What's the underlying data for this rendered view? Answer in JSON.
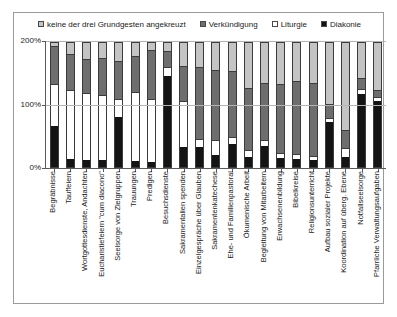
{
  "chart_data": {
    "type": "bar",
    "stacked": true,
    "title": "",
    "subtitle": "",
    "xlabel": "",
    "ylabel": "",
    "ylim": [
      0,
      200
    ],
    "ytick_labels": [
      "0%",
      "100%",
      "200%"
    ],
    "ytick_values": [
      0,
      100,
      200
    ],
    "grid": true,
    "legend_position": "top",
    "legend": [
      {
        "name": "keine der drei Grundgesten angekreuzt",
        "color": "#c4c4c4",
        "swatch": "light-gray"
      },
      {
        "name": "Verkündigung",
        "color": "#6e6e6e",
        "swatch": "dark-gray"
      },
      {
        "name": "Liturgie",
        "color": "#ffffff",
        "swatch": "white"
      },
      {
        "name": "Diakonie",
        "color": "#141414",
        "swatch": "black"
      }
    ],
    "categories": [
      "Begräbnisse",
      "Tauffeiern",
      "Wortgottesdienste, Andachten",
      "Eucharistiefeiern \"cum diacono\"",
      "Seelsorge von Zielgruppen",
      "Trauungen",
      "Predigen",
      "Besuchsdienste",
      "Sakramentalien spenden",
      "Einzelgespräche über Glauben",
      "Sakramentenkatechese",
      "Ehe- und Familienpastoral",
      "Ökumenische Arbeit",
      "Begleitung von Mitarbeitern",
      "Erwachsenenbildung",
      "Bibelkreise",
      "Religionsunterricht",
      "Aufbau sozialer Projekte",
      "Koordination auf überg. Ebene",
      "Notfallseelsorge",
      "Pfarrliche Verwaltungsaufgaben"
    ],
    "series": [
      {
        "name": "Diakonie",
        "color": "#141414",
        "values": [
          68,
          13,
          11,
          12,
          82,
          10,
          9,
          150,
          32,
          32,
          19,
          37,
          17,
          34,
          15,
          13,
          11,
          73,
          16,
          120,
          108
        ]
      },
      {
        "name": "Liturgie",
        "color": "#ffffff",
        "values": [
          67,
          112,
          108,
          105,
          28,
          112,
          101,
          13,
          75,
          12,
          24,
          10,
          9,
          9,
          7,
          7,
          6,
          6,
          14,
          6,
          5
        ]
      },
      {
        "name": "Verkündigung",
        "color": "#6e6e6e",
        "values": [
          60,
          57,
          54,
          58,
          60,
          57,
          79,
          24,
          55,
          117,
          113,
          107,
          100,
          92,
          110,
          117,
          118,
          21,
          28,
          16,
          10
        ]
      },
      {
        "name": "keine der drei Grundgesten angekreuzt",
        "color": "#c4c4c4",
        "values": [
          5,
          18,
          27,
          25,
          30,
          21,
          11,
          13,
          38,
          39,
          44,
          46,
          74,
          65,
          68,
          63,
          65,
          100,
          142,
          58,
          77
        ]
      }
    ]
  },
  "axis": {
    "y_ticks": [
      {
        "label": "200%",
        "value": 200
      },
      {
        "label": "100%",
        "value": 100
      },
      {
        "label": "0%",
        "value": 0
      }
    ]
  }
}
